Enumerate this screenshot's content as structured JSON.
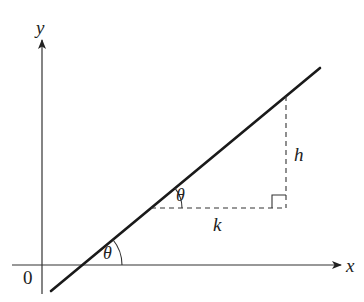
{
  "diagram": {
    "type": "geometry",
    "axes": {
      "x_label": "x",
      "y_label": "y",
      "origin_label": "0"
    },
    "line": {
      "start": [
        51,
        291
      ],
      "end": [
        320,
        68
      ]
    },
    "triangle": {
      "horizontal_leg_label": "k",
      "vertical_leg_label": "h",
      "right_angle_marker": true
    },
    "angles": [
      {
        "label": "θ",
        "location": "line-x-axis-intersection"
      },
      {
        "label": "θ",
        "location": "triangle-base-vertex"
      }
    ],
    "colors": {
      "line": "#1a1a1a",
      "axes": "#333333",
      "dashed": "#333333",
      "background": "#ffffff"
    }
  }
}
